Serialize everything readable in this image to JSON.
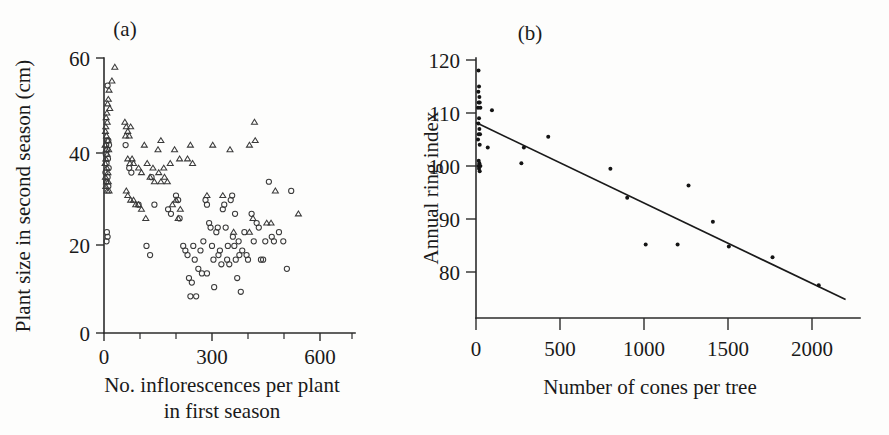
{
  "figure": {
    "background": "#fdfdfc",
    "ink": "#1a1a1a"
  },
  "chart_data": [
    {
      "type": "scatter",
      "panel_label": "(a)",
      "title": "",
      "xlabel": "No. inflorescences per plant",
      "xlabel_line2": "in first season",
      "ylabel": "Plant size in second season (cm)",
      "xlim": [
        0,
        700
      ],
      "ylim": [
        0,
        60
      ],
      "xticks": [
        0,
        100,
        200,
        300,
        400,
        500,
        600,
        700
      ],
      "xticklabels": [
        "0",
        "",
        "",
        "300",
        "",
        "",
        "600",
        ""
      ],
      "yticks": [
        0,
        20,
        40,
        60
      ],
      "yticklabels": [
        "0",
        "20",
        "40",
        "60"
      ],
      "grid": false,
      "legend": "none",
      "series": [
        {
          "name": "triangles",
          "marker": "triangle-open",
          "points": [
            [
              30,
              58
            ],
            [
              22,
              55
            ],
            [
              14,
              53
            ],
            [
              12,
              51
            ],
            [
              10,
              50
            ],
            [
              16,
              49
            ],
            [
              8,
              48
            ],
            [
              6,
              47
            ],
            [
              9,
              46
            ],
            [
              5,
              45
            ],
            [
              58,
              46
            ],
            [
              62,
              45
            ],
            [
              66,
              44
            ],
            [
              70,
              43
            ],
            [
              74,
              45
            ],
            [
              60,
              43
            ],
            [
              4,
              44
            ],
            [
              7,
              43
            ],
            [
              11,
              42
            ],
            [
              3,
              41
            ],
            [
              6,
              40
            ],
            [
              13,
              40
            ],
            [
              9,
              39
            ],
            [
              5,
              38
            ],
            [
              112,
              41
            ],
            [
              150,
              40
            ],
            [
              158,
              42
            ],
            [
              196,
              40
            ],
            [
              240,
              41
            ],
            [
              302,
              41
            ],
            [
              350,
              40
            ],
            [
              404,
              41
            ],
            [
              418,
              46
            ],
            [
              420,
              42
            ],
            [
              66,
              38
            ],
            [
              72,
              37
            ],
            [
              78,
              38
            ],
            [
              82,
              37
            ],
            [
              96,
              36
            ],
            [
              104,
              35
            ],
            [
              120,
              37
            ],
            [
              136,
              36
            ],
            [
              152,
              35
            ],
            [
              166,
              36
            ],
            [
              184,
              37
            ],
            [
              210,
              38
            ],
            [
              232,
              38
            ],
            [
              246,
              37
            ],
            [
              3,
              37
            ],
            [
              8,
              36
            ],
            [
              11,
              35
            ],
            [
              4,
              34
            ],
            [
              7,
              33
            ],
            [
              12,
              33
            ],
            [
              5,
              32
            ],
            [
              9,
              31
            ],
            [
              14,
              31
            ],
            [
              62,
              31
            ],
            [
              66,
              30
            ],
            [
              74,
              29
            ],
            [
              82,
              29
            ],
            [
              88,
              28
            ],
            [
              96,
              28
            ],
            [
              104,
              27
            ],
            [
              116,
              25
            ],
            [
              128,
              34
            ],
            [
              140,
              33
            ],
            [
              158,
              33
            ],
            [
              168,
              34
            ],
            [
              176,
              33
            ],
            [
              190,
              28
            ],
            [
              200,
              29
            ],
            [
              212,
              27
            ],
            [
              206,
              25
            ],
            [
              286,
              30
            ],
            [
              330,
              30
            ],
            [
              404,
              22
            ],
            [
              414,
              25
            ],
            [
              452,
              24
            ],
            [
              464,
              24
            ],
            [
              476,
              31
            ],
            [
              540,
              26
            ],
            [
              360,
              22
            ]
          ]
        },
        {
          "name": "circles",
          "marker": "circle-open",
          "points": [
            [
              10,
              54
            ],
            [
              8,
              42
            ],
            [
              12,
              42
            ],
            [
              6,
              41
            ],
            [
              14,
              41
            ],
            [
              9,
              40
            ],
            [
              5,
              39
            ],
            [
              11,
              38
            ],
            [
              7,
              37
            ],
            [
              13,
              36
            ],
            [
              4,
              35
            ],
            [
              10,
              34
            ],
            [
              6,
              33
            ],
            [
              12,
              32
            ],
            [
              8,
              22
            ],
            [
              10,
              21
            ],
            [
              7,
              20
            ],
            [
              60,
              41
            ],
            [
              70,
              36
            ],
            [
              76,
              35
            ],
            [
              96,
              28
            ],
            [
              132,
              34
            ],
            [
              140,
              28
            ],
            [
              118,
              19
            ],
            [
              128,
              17
            ],
            [
              178,
              27
            ],
            [
              186,
              26
            ],
            [
              200,
              30
            ],
            [
              206,
              29
            ],
            [
              210,
              25
            ],
            [
              220,
              19
            ],
            [
              226,
              18
            ],
            [
              232,
              17
            ],
            [
              236,
              12
            ],
            [
              244,
              11
            ],
            [
              248,
              19
            ],
            [
              252,
              16
            ],
            [
              256,
              8
            ],
            [
              262,
              14
            ],
            [
              268,
              18
            ],
            [
              272,
              13
            ],
            [
              276,
              20
            ],
            [
              282,
              29
            ],
            [
              286,
              28
            ],
            [
              292,
              24
            ],
            [
              296,
              23
            ],
            [
              300,
              19
            ],
            [
              304,
              16
            ],
            [
              306,
              10
            ],
            [
              312,
              22
            ],
            [
              316,
              23
            ],
            [
              318,
              17
            ],
            [
              322,
              18
            ],
            [
              326,
              15
            ],
            [
              330,
              27
            ],
            [
              334,
              28
            ],
            [
              338,
              23
            ],
            [
              342,
              16
            ],
            [
              344,
              19
            ],
            [
              348,
              15
            ],
            [
              352,
              29
            ],
            [
              356,
              30
            ],
            [
              358,
              21
            ],
            [
              362,
              19
            ],
            [
              364,
              26
            ],
            [
              366,
              16
            ],
            [
              370,
              12
            ],
            [
              374,
              20
            ],
            [
              376,
              17
            ],
            [
              380,
              9
            ],
            [
              384,
              18
            ],
            [
              390,
              22
            ],
            [
              396,
              17
            ],
            [
              400,
              16
            ],
            [
              410,
              26
            ],
            [
              416,
              20
            ],
            [
              424,
              24
            ],
            [
              430,
              23
            ],
            [
              436,
              16
            ],
            [
              442,
              16
            ],
            [
              448,
              20
            ],
            [
              458,
              33
            ],
            [
              466,
              21
            ],
            [
              472,
              20
            ],
            [
              486,
              22
            ],
            [
              498,
              20
            ],
            [
              508,
              14
            ],
            [
              520,
              31
            ],
            [
              286,
              13
            ],
            [
              240,
              8
            ]
          ]
        }
      ]
    },
    {
      "type": "scatter",
      "panel_label": "(b)",
      "title": "",
      "xlabel": "Number of cones per tree",
      "ylabel": "Annual ring index",
      "xlim": [
        0,
        2200
      ],
      "ylim": [
        74,
        121
      ],
      "xticks": [
        0,
        500,
        1000,
        1500,
        2000
      ],
      "xticklabels": [
        "0",
        "500",
        "1000",
        "1500",
        "2000"
      ],
      "yticks": [
        80,
        90,
        100,
        110,
        120
      ],
      "yticklabels": [
        "80",
        "90",
        "100",
        "110",
        "120"
      ],
      "grid": false,
      "legend": "none",
      "series": [
        {
          "name": "observations",
          "marker": "dot",
          "points": [
            [
              15,
              118
            ],
            [
              18,
              115
            ],
            [
              14,
              114
            ],
            [
              20,
              113
            ],
            [
              16,
              112
            ],
            [
              22,
              112
            ],
            [
              12,
              111
            ],
            [
              26,
              111
            ],
            [
              95,
              110.5
            ],
            [
              18,
              109
            ],
            [
              14,
              108
            ],
            [
              20,
              107
            ],
            [
              16,
              106
            ],
            [
              24,
              106
            ],
            [
              12,
              105
            ],
            [
              22,
              104
            ],
            [
              70,
              103.5
            ],
            [
              16,
              101
            ],
            [
              20,
              100.5
            ],
            [
              14,
              100
            ],
            [
              26,
              100
            ],
            [
              18,
              99.5
            ],
            [
              22,
              99
            ],
            [
              285,
              103.5
            ],
            [
              270,
              100.5
            ],
            [
              430,
              105.5
            ],
            [
              800,
              99.5
            ],
            [
              900,
              94
            ],
            [
              1010,
              85.2
            ],
            [
              1200,
              85.2
            ],
            [
              1265,
              96.3
            ],
            [
              1410,
              89.5
            ],
            [
              1505,
              84.8
            ],
            [
              1765,
              82.8
            ],
            [
              2040,
              77.5
            ]
          ]
        }
      ],
      "fit_line": {
        "name": "regression-line",
        "x_start": 0,
        "y_start": 108.2,
        "x_end": 2200,
        "y_end": 74.8
      }
    }
  ]
}
